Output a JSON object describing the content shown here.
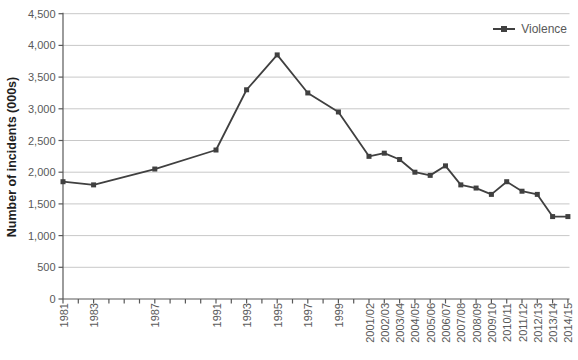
{
  "chart_data": {
    "type": "line",
    "ylabel": "Number of incidents (000s)",
    "xlabel": "",
    "ylim": [
      0,
      4500
    ],
    "ytick_step": 500,
    "ytick_labels": [
      "0",
      "500",
      "1,000",
      "1,500",
      "2,000",
      "2,500",
      "3,000",
      "3,500",
      "4,000",
      "4,500"
    ],
    "x_year_range": [
      1981,
      2014
    ],
    "grid": "horizontal",
    "categories": [
      "1981",
      "1983",
      "1987",
      "1991",
      "1993",
      "1995",
      "1997",
      "1999",
      "2001/02",
      "2002/03",
      "2003/04",
      "2004/05",
      "2005/06",
      "2006/07",
      "2007/08",
      "2008/09",
      "2009/10",
      "2010/11",
      "2011/12",
      "2012/13",
      "2013/14",
      "2014/15"
    ],
    "series": [
      {
        "name": "Violence",
        "marker": "square",
        "values": [
          1850,
          1800,
          2050,
          2350,
          3300,
          3850,
          3250,
          2950,
          2250,
          2300,
          2200,
          2000,
          1950,
          2100,
          1800,
          1750,
          1650,
          1850,
          1700,
          1650,
          1300,
          1300
        ]
      }
    ],
    "legend": {
      "position": "top-right",
      "entries": [
        "Violence"
      ]
    },
    "colors": {
      "line": "#404040",
      "marker": "#404040",
      "grid": "#c8c8c8",
      "axis": "#595959",
      "tick_text": "#595959",
      "axis_title_text": "#1f1f1f",
      "legend_text": "#595959",
      "background": "#ffffff"
    }
  }
}
